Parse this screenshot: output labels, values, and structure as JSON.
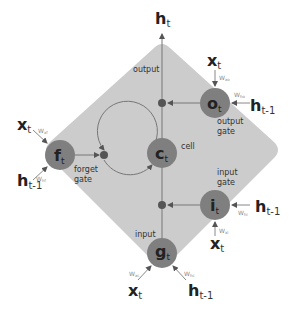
{
  "diagram": {
    "colors": {
      "background": "#ffffff",
      "diamond_fill": "#cccccc",
      "node_fill": "#7f7f7f",
      "line": "#777777",
      "dot": "#555555",
      "text": "#222222",
      "weight_text": "#888888"
    },
    "output": {
      "symbol": "h",
      "subscript": "t"
    },
    "labels": {
      "output": "output",
      "cell": "cell",
      "output_gate_line1": "output",
      "output_gate_line2": "gate",
      "forget_gate_line1": "forget",
      "forget_gate_line2": "gate",
      "input_gate_line1": "input",
      "input_gate_line2": "gate",
      "input": "input"
    },
    "nodes": {
      "o": {
        "symbol": "o",
        "subscript": "t"
      },
      "c": {
        "symbol": "c",
        "subscript": "t"
      },
      "f": {
        "symbol": "f",
        "subscript": "t"
      },
      "i": {
        "symbol": "i",
        "subscript": "t"
      },
      "g": {
        "symbol": "g",
        "subscript": "t"
      }
    },
    "inputs": {
      "x": {
        "symbol": "x",
        "subscript": "t"
      },
      "h_prev": {
        "symbol": "h",
        "subscript": "t-1"
      }
    },
    "weights": {
      "xo": "W",
      "xo_sub": "xo",
      "ho": "W",
      "ho_sub": "ho",
      "xf": "W",
      "xf_sub": "xf",
      "hf": "W",
      "hf_sub": "hf",
      "xi": "W",
      "xi_sub": "xi",
      "hi": "W",
      "hi_sub": "hi",
      "xc": "W",
      "xc_sub": "xc",
      "hc": "W",
      "hc_sub": "hc"
    }
  }
}
